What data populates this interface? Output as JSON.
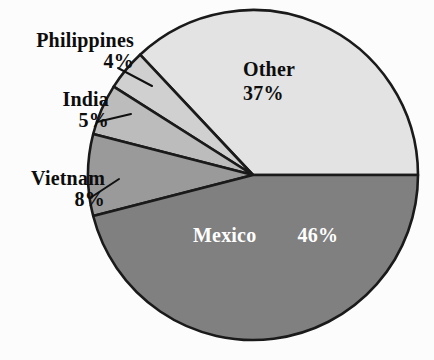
{
  "chart_data": {
    "type": "pie",
    "title": "",
    "categories": [
      "Other",
      "Philippines",
      "India",
      "Vietnam",
      "Mexico"
    ],
    "values": [
      37,
      4,
      5,
      8,
      46
    ],
    "value_labels": [
      "37%",
      "4%",
      "5%",
      "8%",
      "46%"
    ],
    "units": "percent",
    "total": 100,
    "start_angle_deg": 0,
    "direction": "counterclockwise",
    "legend": "none",
    "grid": false,
    "slices": [
      {
        "label": "Other",
        "percent_text": "37%",
        "value": 37,
        "color": "#e3e3e3",
        "label_placement": "inside",
        "label_color": "#0d0d0d"
      },
      {
        "label": "Philippines",
        "percent_text": "4%",
        "value": 4,
        "color": "#d0d0d0",
        "label_placement": "outside-left",
        "label_color": "#0d0d0d"
      },
      {
        "label": "India",
        "percent_text": "5%",
        "value": 5,
        "color": "#bcbcbc",
        "label_placement": "outside-left",
        "label_color": "#0d0d0d"
      },
      {
        "label": "Vietnam",
        "percent_text": "8%",
        "value": 8,
        "color": "#9a9a9a",
        "label_placement": "outside-left",
        "label_color": "#0d0d0d"
      },
      {
        "label": "Mexico",
        "percent_text": "46%",
        "value": 46,
        "color": "#808080",
        "label_placement": "inside",
        "label_color": "#ffffff"
      }
    ],
    "style": {
      "background": "#fcfcfc",
      "stroke": "#1a1a1a",
      "leader_line": "#111111"
    }
  }
}
